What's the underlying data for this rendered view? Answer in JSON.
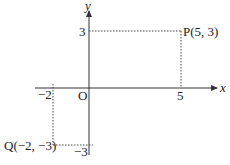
{
  "diagram": {
    "type": "coordinate-plane",
    "axes": {
      "x_label": "x",
      "y_label": "y",
      "origin_label": "O"
    },
    "ticks": {
      "x_pos": "5",
      "x_neg": "−2",
      "y_pos": "3",
      "y_neg": "−3"
    },
    "points": [
      {
        "name": "P",
        "label": "P(5, 3)",
        "x": 5,
        "y": 3
      },
      {
        "name": "Q",
        "label": "Q(−2, −3)",
        "x": -2,
        "y": -3
      }
    ],
    "colors": {
      "axis": "#333333",
      "dotted": "#444444",
      "text": "#222222",
      "background": "#ffffff"
    }
  }
}
